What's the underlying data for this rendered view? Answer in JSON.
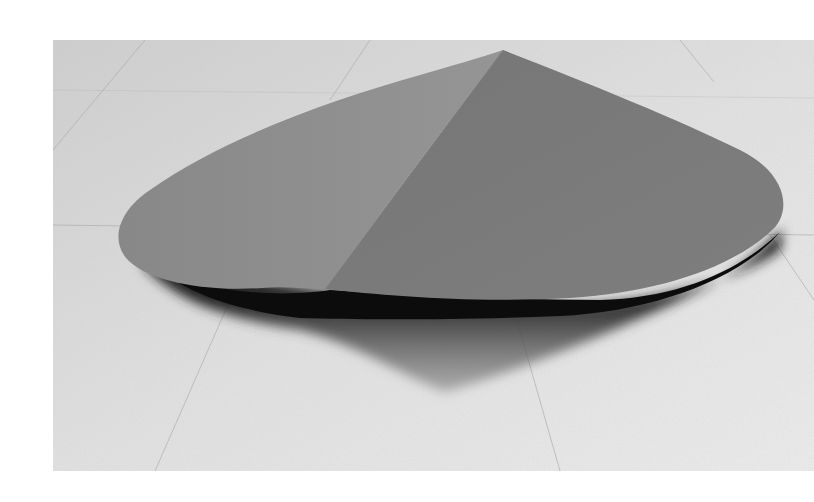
{
  "image": {
    "subject": "folded sheet metal floor sculpture",
    "description": "Grayscale photograph of a large flat, rounded, leaf-like sheet sculpture lying on a speckled terrazzo floor, folded along a diagonal crease, casting a dark shadow beneath.",
    "colors": {
      "floor": "#d6d6d6",
      "floor_light": "#ececec",
      "left_plane": "#8f8f8f",
      "right_plane": "#7a7a7a",
      "shadow": "#141414",
      "page_background": "#ffffff"
    }
  }
}
